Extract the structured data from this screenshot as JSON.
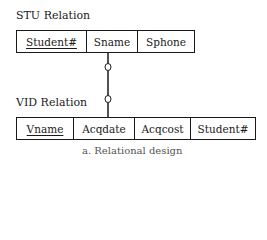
{
  "diagram": {
    "relations": [
      {
        "title": "STU Relation",
        "columns": [
          {
            "name": "Student#",
            "primary_key": true
          },
          {
            "name": "Sname",
            "primary_key": false
          },
          {
            "name": "Sphone",
            "primary_key": false
          }
        ]
      },
      {
        "title": "VID Relation",
        "columns": [
          {
            "name": "Vname",
            "primary_key": true
          },
          {
            "name": "Acqdate",
            "primary_key": false
          },
          {
            "name": "Acqcost",
            "primary_key": false
          },
          {
            "name": "Student#",
            "primary_key": false
          }
        ]
      }
    ],
    "relationship": {
      "from": "STU Relation",
      "to": "VID Relation",
      "notation": "optional-optional (circle markers on both ends)"
    },
    "caption": "a. Relational design"
  }
}
